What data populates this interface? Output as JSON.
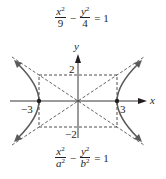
{
  "top_equation": {
    "num1": "x",
    "num1_exp": "2",
    "den1": "9",
    "minus": "−",
    "num2": "y",
    "num2_exp": "2",
    "den2": "4",
    "equals": "= 1"
  },
  "bottom_equation": {
    "num1": "x",
    "num1_exp": "2",
    "den1": "a",
    "den1_exp": "2",
    "minus": "−",
    "num2": "y",
    "num2_exp": "2",
    "den2": "b",
    "den2_exp": "2",
    "equals": "= 1"
  },
  "axes": {
    "x_label": "x",
    "y_label": "y",
    "tick_pos_x": "3",
    "tick_neg_x": "−3",
    "tick_pos_y": "2",
    "tick_neg_y": "−2"
  },
  "colors": {
    "curve": "#5b5b5b",
    "axis": "#231f20",
    "dashed": "#231f20"
  }
}
